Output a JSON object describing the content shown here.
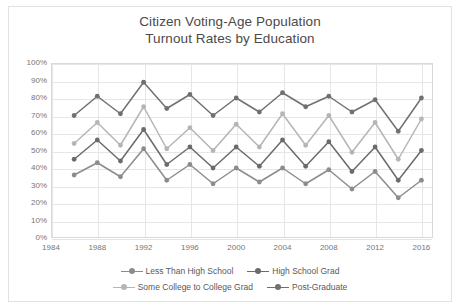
{
  "chart_data": {
    "type": "line",
    "title": "Citizen Voting-Age Population Turnout Rates by Education",
    "title_line1": "Citizen Voting-Age Population",
    "title_line2": "Turnout Rates by Education",
    "xlabel": "",
    "ylabel": "",
    "ylim": [
      0,
      100
    ],
    "ytick_labels": [
      "100%",
      "90%",
      "80%",
      "70%",
      "60%",
      "50%",
      "40%",
      "30%",
      "20%",
      "10%",
      "0%"
    ],
    "ytick_values": [
      100,
      90,
      80,
      70,
      60,
      50,
      40,
      30,
      20,
      10,
      0
    ],
    "xtick_labels": [
      "1984",
      "1988",
      "1992",
      "1996",
      "2000",
      "2004",
      "2008",
      "2012",
      "2016"
    ],
    "xtick_values": [
      1984,
      1988,
      1992,
      1996,
      2000,
      2004,
      2008,
      2012,
      2016
    ],
    "xlim": [
      1984,
      2017
    ],
    "grid": true,
    "legend_position": "bottom",
    "x": [
      1986,
      1988,
      1990,
      1992,
      1994,
      1996,
      1998,
      2000,
      2002,
      2004,
      2006,
      2008,
      2010,
      2012,
      2014,
      2016
    ],
    "series": [
      {
        "name": "Less Than High School",
        "color": "#8c8c8c",
        "values": [
          36,
          43,
          35,
          51,
          33,
          42,
          31,
          40,
          32,
          40,
          31,
          39,
          28,
          38,
          23,
          33
        ]
      },
      {
        "name": "High School Grad",
        "color": "#6b6b6b",
        "values": [
          45,
          56,
          44,
          62,
          42,
          52,
          40,
          52,
          41,
          56,
          41,
          55,
          38,
          52,
          33,
          50
        ]
      },
      {
        "name": "Some College to College Grad",
        "color": "#b5b5b5",
        "values": [
          54,
          66,
          53,
          75,
          51,
          63,
          50,
          65,
          52,
          71,
          53,
          70,
          49,
          66,
          45,
          68
        ]
      },
      {
        "name": "Post-Graduate",
        "color": "#707070",
        "values": [
          70,
          81,
          71,
          89,
          74,
          82,
          70,
          80,
          72,
          83,
          75,
          81,
          72,
          79,
          61,
          80
        ]
      }
    ]
  },
  "legend": {
    "items": [
      {
        "label": "Less Than High School"
      },
      {
        "label": "High School Grad"
      },
      {
        "label": "Some College to College Grad"
      },
      {
        "label": "Post-Graduate"
      }
    ]
  }
}
